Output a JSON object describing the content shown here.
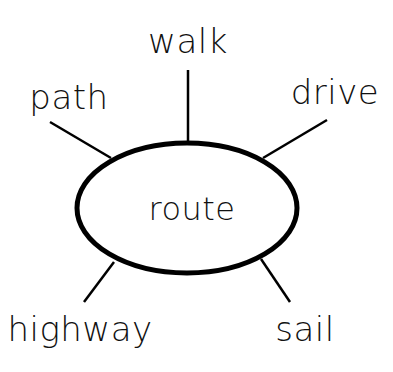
{
  "diagram": {
    "type": "word-web",
    "center": {
      "label": "route",
      "cx": 187,
      "cy": 208,
      "rx": 111,
      "ry": 66
    },
    "branches": [
      {
        "label": "walk",
        "x": 188,
        "y": 28,
        "line": [
          188,
          70,
          188,
          143
        ]
      },
      {
        "label": "path",
        "x": 69,
        "y": 80,
        "line": [
          50,
          122,
          111,
          158
        ]
      },
      {
        "label": "drive",
        "x": 334,
        "y": 78,
        "line": [
          327,
          120,
          263,
          158
        ]
      },
      {
        "label": "highway",
        "x": 80,
        "y": 313,
        "line": [
          84,
          302,
          114,
          262
        ]
      },
      {
        "label": "sail",
        "x": 305,
        "y": 313,
        "line": [
          290,
          302,
          261,
          259
        ]
      }
    ],
    "colors": {
      "stroke": "#000000",
      "text": "#111111",
      "background": "#ffffff"
    }
  }
}
